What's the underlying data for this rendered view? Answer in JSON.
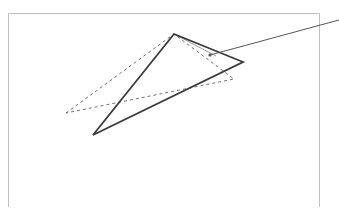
{
  "diagram": {
    "canvas": {
      "width": 339,
      "height": 207,
      "background": "#ffffff"
    },
    "frame": {
      "left": 8.5,
      "top": 13.5,
      "right": 319.5,
      "bottom": 207,
      "stroke": "#bdbdbd",
      "open_bottom": true
    },
    "solid_triangle": {
      "points": [
        [
          174,
          34
        ],
        [
          243,
          62
        ],
        [
          93,
          135
        ]
      ],
      "stroke": "#3a3a3a",
      "stroke_width": 1.8
    },
    "solid_triangle_inner_edge": {
      "points": [
        [
          174,
          34
        ],
        [
          216,
          56
        ]
      ],
      "stroke": "#9a9a9a"
    },
    "dashed_triangle": {
      "points": [
        [
          66,
          113
        ],
        [
          174,
          34
        ],
        [
          234,
          79
        ]
      ],
      "stroke": "#707070",
      "dash": "3 3"
    },
    "leader": {
      "from": [
        210,
        55
      ],
      "to": [
        339,
        20
      ],
      "stroke": "#555555",
      "dot_radius": 1.6
    }
  }
}
